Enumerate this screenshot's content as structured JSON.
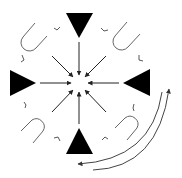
{
  "diagram": {
    "width": 182,
    "height": 178,
    "center": [
      79,
      83
    ],
    "colors": {
      "background": "#ffffff",
      "triangle_fill": "#000000",
      "arrow_stroke": "#222222",
      "loop_stroke": "#666666",
      "tick_stroke": "#444444",
      "arc_stroke": "#444444"
    },
    "triangles": [
      {
        "name": "top-triangle",
        "direction": "down",
        "points": [
          [
            66,
            13
          ],
          [
            93,
            13
          ],
          [
            79,
            38
          ]
        ]
      },
      {
        "name": "left-triangle",
        "direction": "right",
        "points": [
          [
            10,
            70
          ],
          [
            10,
            96
          ],
          [
            36,
            83
          ]
        ]
      },
      {
        "name": "right-triangle",
        "direction": "left",
        "points": [
          [
            150,
            69
          ],
          [
            150,
            96
          ],
          [
            123,
            83
          ]
        ]
      },
      {
        "name": "bottom-triangle",
        "direction": "up",
        "points": [
          [
            66,
            154
          ],
          [
            93,
            154
          ],
          [
            79,
            128
          ]
        ]
      }
    ],
    "converging_arrows": [
      {
        "name": "arrow-from-top",
        "from": [
          79,
          42
        ],
        "to": [
          79,
          75
        ]
      },
      {
        "name": "arrow-from-bottom",
        "from": [
          79,
          124
        ],
        "to": [
          79,
          92
        ]
      },
      {
        "name": "arrow-from-left",
        "from": [
          40,
          83
        ],
        "to": [
          71,
          83
        ]
      },
      {
        "name": "arrow-from-right",
        "from": [
          119,
          83
        ],
        "to": [
          88,
          83
        ]
      },
      {
        "name": "arrow-from-top-left",
        "from": [
          52,
          56
        ],
        "to": [
          73,
          77
        ]
      },
      {
        "name": "arrow-from-top-right",
        "from": [
          106,
          56
        ],
        "to": [
          85,
          77
        ]
      },
      {
        "name": "arrow-from-bottom-left",
        "from": [
          52,
          112
        ],
        "to": [
          73,
          90
        ]
      },
      {
        "name": "arrow-from-bottom-right",
        "from": [
          106,
          112
        ],
        "to": [
          85,
          90
        ]
      }
    ],
    "loops": [
      {
        "name": "loop-top-left",
        "path": "M 35 23 L 23 37 A 8 8 0 0 0 36 48 L 47 36"
      },
      {
        "name": "loop-top-right",
        "path": "M 127 22 L 115 36 A 8 8 0 0 0 128 47 L 140 34"
      },
      {
        "name": "loop-bottom-left",
        "path": "M 21 131 L 32 120 A 8 8 0 0 1 43 131 L 33 143"
      },
      {
        "name": "loop-bottom-right",
        "path": "M 115 128 L 125 118 A 8 8 0 0 1 137 128 L 127 140"
      }
    ],
    "ticks": [
      {
        "name": "tick-top-left-a",
        "path": "M 54 28 L 57 30 L 60 27"
      },
      {
        "name": "tick-top-left-b",
        "path": "M 22 55 L 24 60 L 21 62"
      },
      {
        "name": "tick-top-right-a",
        "path": "M 101 28 L 104 31 L 108 30"
      },
      {
        "name": "tick-top-right-b",
        "path": "M 139 55 L 139 60 L 143 61"
      },
      {
        "name": "tick-bottom-left-a",
        "path": "M 24 102 L 26 105 L 25 108"
      },
      {
        "name": "tick-bottom-left-b",
        "path": "M 54 138 L 58 137 L 60 141"
      },
      {
        "name": "tick-bottom-right-a",
        "path": "M 102 140 L 105 137 L 108 139"
      },
      {
        "name": "tick-bottom-right-b",
        "path": "M 134 104 L 133 108 L 134 111"
      }
    ],
    "rotation_arcs": [
      {
        "name": "outer-arc-clockwise-up",
        "path": "M 93 170 Q 158 168 169 89",
        "arrow_end": "up"
      },
      {
        "name": "inner-arc-counterclockwise-left",
        "path": "M 162 92 Q 152 160 78 164",
        "arrow_end": "left"
      }
    ]
  }
}
